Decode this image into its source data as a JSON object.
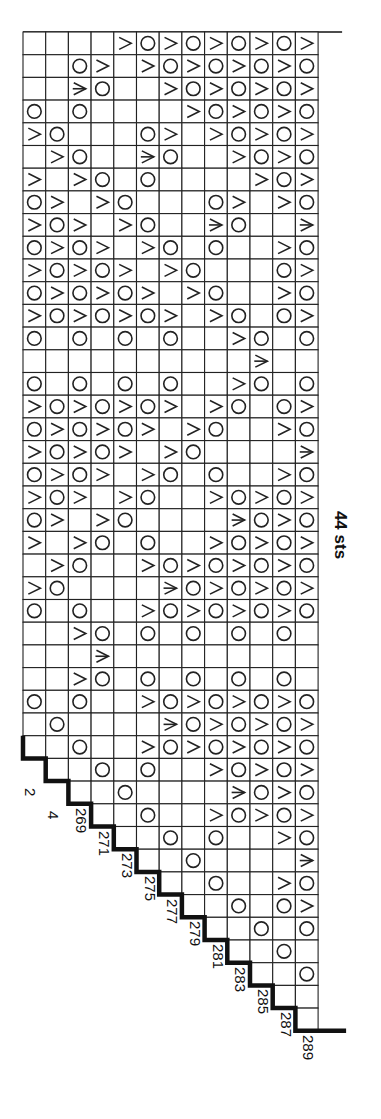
{
  "chart": {
    "title_fragment": "",
    "width_label": "44 sts",
    "columns": 13,
    "rows": 44,
    "cell_px": 22.7,
    "origin": {
      "x": 23,
      "y": 32
    },
    "legend": {
      ".": "empty (knit)",
      "O": "yarn-over",
      ">": "decrease",
      "*": "double-decrease"
    },
    "grid": [
      "....>O>O>O>O>",
      "..O>.>O>O>O>O",
      "..*O..>O>O>O>",
      "O.O....>O>O>O",
      ">O...O>.>O>O>",
      ".>O..*O..>O>O",
      ">.>O.O....>O>",
      "O>.>O...O>.>O",
      ">O>.>O..*O..*",
      "O>O>.>O.O..>O",
      ">O>O>.>O...O>",
      "O>O>O>.>O..>O",
      ">O>O>O>.>O.O>",
      "O.O.O.O..>O.O",
      "..........*..",
      "O.O.O.O..>O.O",
      ">O>O>O>.>O.O>",
      "O>O>O>.>O..>O",
      ">O>O>.>O....*",
      "O>O>.>O.O..>O",
      ">O>.>O..>O>O>",
      "O>.>O....*O>O",
      ">.>O.O..>O>O>",
      ".>O..>O>O>O>O",
      ">O....*O>O>O>",
      "O.O..>O>O>O>O",
      "..>O.O.O.O.O.",
      "...*.........",
      "..>O.O.O.O.O.",
      "O.O..>O>O>O>O",
      ".O....*O>O>O>",
      "..O..>O>O>O>O",
      "...O.O..>O>O>",
      "....O....*O>O",
      ".....O..>O>O>",
      "......O.O..>O",
      ".......O....*",
      "........O..>O",
      ".........O.O>",
      "..........O.O",
      "...........O.",
      "............O",
      ".............",
      "............."
    ],
    "staircase_start_row": 32,
    "row_labels": [
      "2",
      "4",
      "269",
      "271",
      "273",
      "275",
      "277",
      "279",
      "281",
      "283",
      "285",
      "287",
      "289"
    ]
  }
}
